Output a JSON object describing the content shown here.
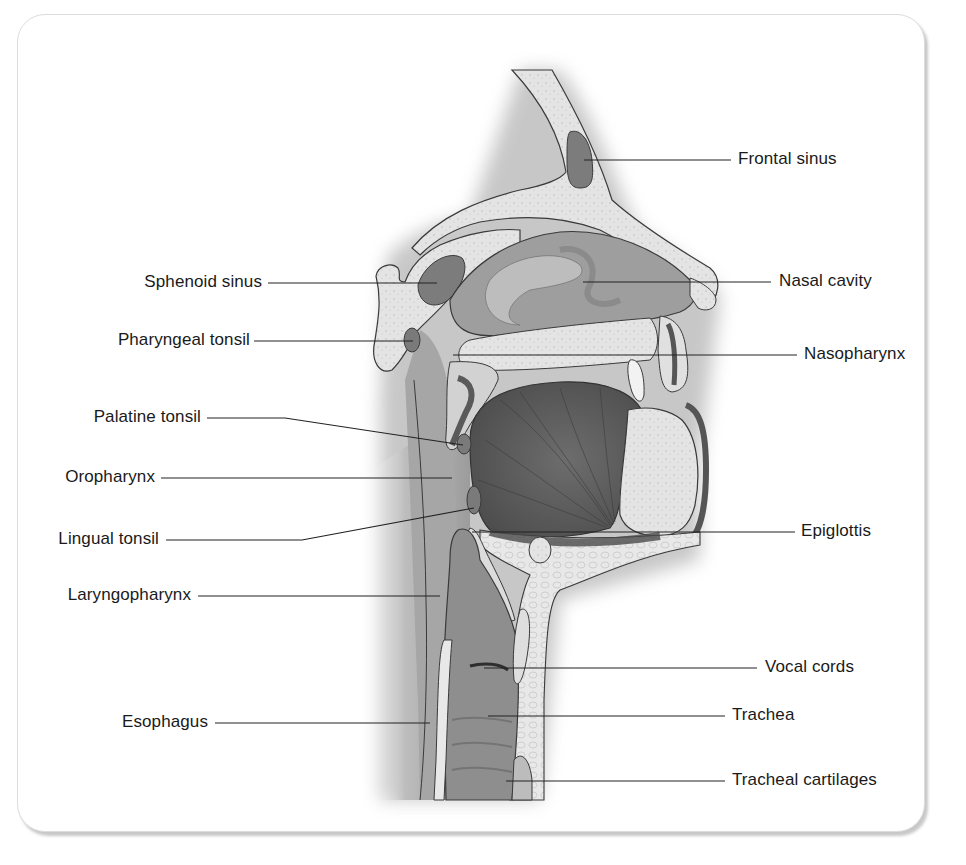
{
  "figure": {
    "colors": {
      "background": "#ffffff",
      "frame_border": "#dcdcdc",
      "label_text": "#1a1a1a",
      "leader_line": "#222222",
      "bone": "#e6e6e6",
      "soft_tissue": "#8c8c8c",
      "cavity": "#9a9a9a",
      "dark_muscle": "#555555",
      "sinus": "#7a7a7a"
    }
  },
  "labels": {
    "left": [
      {
        "id": "sphenoid-sinus",
        "text": "Sphenoid sinus",
        "label_right_x": 262,
        "y": 283,
        "line": [
          [
            268,
            283
          ],
          [
            437,
            283
          ]
        ]
      },
      {
        "id": "pharyngeal-tonsil",
        "text": "Pharyngeal tonsil",
        "label_right_x": 250,
        "y": 341,
        "line": [
          [
            254,
            341
          ],
          [
            413,
            341
          ]
        ]
      },
      {
        "id": "palatine-tonsil",
        "text": "Palatine tonsil",
        "label_right_x": 201,
        "y": 418,
        "line": [
          [
            207,
            418
          ],
          [
            285,
            418
          ],
          [
            463,
            445
          ]
        ]
      },
      {
        "id": "oropharynx",
        "text": "Oropharynx",
        "label_right_x": 155,
        "y": 478,
        "line": [
          [
            161,
            478
          ],
          [
            452,
            478
          ]
        ]
      },
      {
        "id": "lingual-tonsil",
        "text": "Lingual tonsil",
        "label_right_x": 159,
        "y": 540,
        "line": [
          [
            166,
            540
          ],
          [
            302,
            540
          ],
          [
            474,
            508
          ]
        ]
      },
      {
        "id": "laryngopharynx",
        "text": "Laryngopharynx",
        "label_right_x": 191,
        "y": 596,
        "line": [
          [
            198,
            596
          ],
          [
            440,
            596
          ]
        ]
      },
      {
        "id": "esophagus",
        "text": "Esophagus",
        "label_right_x": 208,
        "y": 723,
        "line": [
          [
            215,
            723
          ],
          [
            430,
            723
          ]
        ]
      }
    ],
    "right": [
      {
        "id": "frontal-sinus",
        "text": "Frontal sinus",
        "label_left_x": 738,
        "y": 160,
        "line": [
          [
            584,
            160
          ],
          [
            731,
            160
          ]
        ]
      },
      {
        "id": "nasal-cavity",
        "text": "Nasal cavity",
        "label_left_x": 779,
        "y": 282,
        "line": [
          [
            583,
            282
          ],
          [
            771,
            282
          ]
        ]
      },
      {
        "id": "nasopharynx",
        "text": "Nasopharynx",
        "label_left_x": 804,
        "y": 355,
        "line": [
          [
            453,
            355
          ],
          [
            797,
            355
          ]
        ]
      },
      {
        "id": "epiglottis",
        "text": "Epiglottis",
        "label_left_x": 801,
        "y": 532,
        "line": [
          [
            472,
            532
          ],
          [
            795,
            532
          ]
        ]
      },
      {
        "id": "vocal-cords",
        "text": "Vocal cords",
        "label_left_x": 765,
        "y": 668,
        "line": [
          [
            484,
            668
          ],
          [
            757,
            668
          ]
        ]
      },
      {
        "id": "trachea",
        "text": "Trachea",
        "label_left_x": 732,
        "y": 716,
        "line": [
          [
            488,
            716
          ],
          [
            725,
            716
          ]
        ]
      },
      {
        "id": "tracheal-cartilages",
        "text": "Tracheal cartilages",
        "label_left_x": 732,
        "y": 781,
        "line": [
          [
            506,
            781
          ],
          [
            725,
            781
          ]
        ]
      }
    ]
  }
}
